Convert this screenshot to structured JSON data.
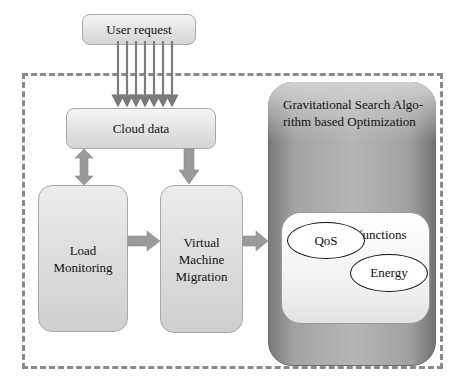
{
  "diagram": {
    "nodes": {
      "user_request": "User request",
      "cloud_data": "Cloud data",
      "load_monitoring": "Load\nMonitoring",
      "vm_migration": "Virtual\nMachine\nMigration",
      "gsa": "Gravitational Search Algo-\nrithm based Optimization",
      "objective_functions": "Objective functions",
      "qos": "QoS",
      "energy": "Energy"
    },
    "edges": [
      {
        "from": "user_request",
        "to": "cloud_data",
        "style": "7 parallel arrows"
      },
      {
        "from": "cloud_data",
        "to": "load_monitoring",
        "style": "bidirectional"
      },
      {
        "from": "cloud_data",
        "to": "vm_migration",
        "style": "arrow"
      },
      {
        "from": "load_monitoring",
        "to": "vm_migration",
        "style": "arrow"
      },
      {
        "from": "vm_migration",
        "to": "gsa",
        "style": "arrow"
      }
    ],
    "colors": {
      "arrow": "#8c8c8c",
      "dashed_border": "#8a8a8a",
      "gsa_box": "#a5a5a5",
      "light_box": "#e0e0e0"
    }
  }
}
